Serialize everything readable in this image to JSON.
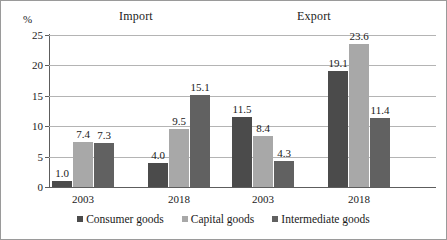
{
  "chart_data": {
    "type": "bar",
    "title": "",
    "xlabel": "",
    "ylabel": "%",
    "ylim": [
      0,
      25
    ],
    "yticks": [
      0,
      5,
      10,
      15,
      20,
      25
    ],
    "grid": true,
    "legend_position": "bottom",
    "panels": [
      {
        "name": "Import"
      },
      {
        "name": "Export"
      }
    ],
    "categories": [
      "2003",
      "2018",
      "2003",
      "2018"
    ],
    "series": [
      {
        "name": "Consumer goods",
        "color": "#4b4b4b",
        "values": [
          1.0,
          4.0,
          11.5,
          19.1
        ]
      },
      {
        "name": "Capital goods",
        "color": "#a8a8a8",
        "values": [
          7.4,
          9.5,
          8.4,
          23.6
        ]
      },
      {
        "name": "Intermediate goods",
        "color": "#616161",
        "values": [
          7.3,
          15.1,
          4.3,
          11.4
        ]
      }
    ],
    "data_labels": [
      [
        "1.0",
        "7.4",
        "7.3"
      ],
      [
        "4.0",
        "9.5",
        "15.1"
      ],
      [
        "11.5",
        "8.4",
        "4.3"
      ],
      [
        "19.1",
        "23.6",
        "11.4"
      ]
    ],
    "ytick_labels": [
      "0",
      "5",
      "10",
      "15",
      "20",
      "25"
    ]
  }
}
